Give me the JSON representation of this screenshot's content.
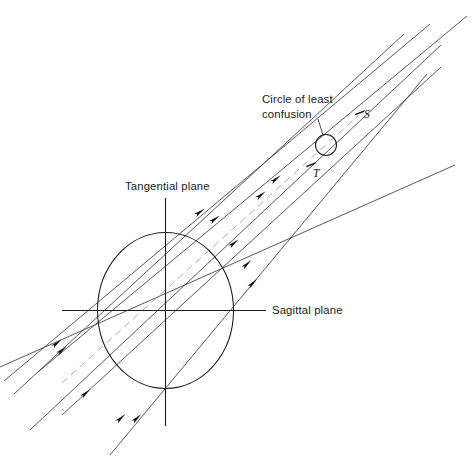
{
  "figure": {
    "type": "optics-ray-diagram",
    "width": 473,
    "height": 463,
    "background_color": "#ffffff",
    "line_color": "#3a3a3a",
    "dark_line_color": "#1a1a1a",
    "text_color": "#1a1a1a"
  },
  "labels": {
    "circle_of_least_confusion_line1": "Circle of least",
    "circle_of_least_confusion_line2": "confusion",
    "tangential_plane": "Tangential plane",
    "sagittal_plane": "Sagittal plane",
    "tangential_focus": "T",
    "sagittal_focus": "S"
  },
  "chart_data": {
    "type": "line",
    "title": "",
    "xlabel": "",
    "ylabel": "",
    "axis_planes": [
      {
        "name": "tangential-plane-axis",
        "orientation": "vertical",
        "x": 165.5,
        "y1": 198,
        "y2": 426,
        "label": "Tangential plane",
        "label_x": 126,
        "label_y": 189
      },
      {
        "name": "sagittal-plane-axis",
        "orientation": "horizontal",
        "y": 310.5,
        "x1": 62,
        "x2": 266,
        "label": "Sagittal plane",
        "label_x": 272,
        "label_y": 314
      }
    ],
    "aperture_ellipse": {
      "cx": 165.5,
      "cy": 310.5,
      "rx": 68,
      "ry": 78
    },
    "circle_of_least_confusion": {
      "cx": 326,
      "cy": 145,
      "r": 10.5
    },
    "focus_points": [
      {
        "name": "T",
        "x": 311,
        "y": 164,
        "label_x": 313,
        "label_y": 175
      },
      {
        "name": "S",
        "x": 360,
        "y": 112,
        "label_x": 364,
        "label_y": 117
      }
    ],
    "leader_line": {
      "x1": 318,
      "y1": 120,
      "x2": 322,
      "y2": 136
    },
    "rays": [
      {
        "id": "t1",
        "x1": 4,
        "y1": 381,
        "x2": 430,
        "y2": 24,
        "style": "solid",
        "weight": "thin"
      },
      {
        "id": "t2",
        "x1": 14,
        "y1": 394,
        "x2": 404,
        "y2": 34,
        "style": "solid",
        "weight": "thin"
      },
      {
        "id": "t3",
        "x1": 38,
        "y1": 372,
        "x2": 467,
        "y2": 16,
        "style": "solid",
        "weight": "thin"
      },
      {
        "id": "t4",
        "x1": 62,
        "y1": 415,
        "x2": 441,
        "y2": 67,
        "style": "solid",
        "weight": "thin"
      },
      {
        "id": "t5",
        "x1": 110,
        "y1": 455,
        "x2": 427,
        "y2": 74,
        "style": "solid",
        "weight": "thin"
      },
      {
        "id": "s1",
        "x1": 0,
        "y1": 367,
        "x2": 455,
        "y2": 165,
        "style": "solid",
        "weight": "thin"
      },
      {
        "id": "s2",
        "x1": 30,
        "y1": 430,
        "x2": 441,
        "y2": 45,
        "style": "solid",
        "weight": "thin"
      },
      {
        "id": "dash",
        "x1": 62,
        "y1": 383,
        "x2": 358,
        "y2": 116,
        "style": "dashed",
        "weight": "thin"
      }
    ],
    "arrowheads": [
      {
        "x": 57,
        "y": 343,
        "angle": -40
      },
      {
        "x": 62,
        "y": 350,
        "angle": -40
      },
      {
        "x": 86,
        "y": 393,
        "angle": -41
      },
      {
        "x": 121,
        "y": 418,
        "angle": -42
      },
      {
        "x": 137,
        "y": 418,
        "angle": -43
      },
      {
        "x": 200,
        "y": 212,
        "angle": -36
      },
      {
        "x": 215,
        "y": 219,
        "angle": -36
      },
      {
        "x": 234,
        "y": 243,
        "angle": -40
      },
      {
        "x": 247,
        "y": 264,
        "angle": -43
      },
      {
        "x": 253,
        "y": 283,
        "angle": -45
      },
      {
        "x": 261,
        "y": 195,
        "angle": -38
      },
      {
        "x": 276,
        "y": 179,
        "angle": -38
      }
    ]
  }
}
